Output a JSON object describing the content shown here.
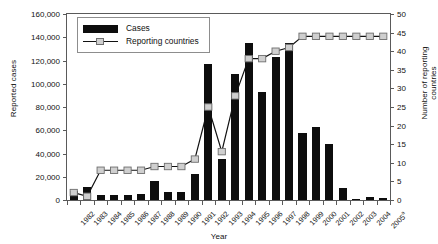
{
  "chart_data": {
    "type": "bar",
    "title": "",
    "xlabel": "Year",
    "ylabel": "Reported cases",
    "y2label": "Number of reporting countries",
    "grid": false,
    "legend_position": "upper-left-inside",
    "categories": [
      "1982",
      "1983",
      "1984",
      "1985",
      "1986",
      "1987",
      "1988",
      "1989",
      "1990",
      "1991",
      "1992",
      "1993",
      "1994",
      "1995",
      "1996",
      "1997",
      "1998",
      "1999",
      "2000",
      "2001",
      "2002",
      "2003",
      "2004",
      "2005"
    ],
    "category_labels": [
      "1982",
      "1983",
      "1984",
      "1985",
      "1986",
      "1987",
      "1988",
      "1989",
      "1990",
      "1991",
      "1992",
      "1993",
      "1994",
      "1995",
      "1996",
      "1997",
      "1998",
      "1999",
      "2000",
      "2001",
      "2002",
      "2003",
      "2004",
      "2005"
    ],
    "last_category_superscript": "a",
    "ylim": [
      0,
      160000
    ],
    "yticks": [
      0,
      20000,
      40000,
      60000,
      80000,
      100000,
      120000,
      140000,
      160000
    ],
    "ytick_labels": [
      "0",
      "20,000",
      "40,000",
      "60,000",
      "80,000",
      "100,000",
      "120,000",
      "140,000",
      "160,000"
    ],
    "y2lim": [
      0,
      50
    ],
    "y2ticks": [
      0,
      5,
      10,
      15,
      20,
      25,
      30,
      35,
      40,
      45,
      50
    ],
    "y2tick_labels": [
      "0",
      "5",
      "10",
      "15",
      "20",
      "25",
      "30",
      "35",
      "40",
      "45",
      "50"
    ],
    "series": [
      {
        "name": "Cases",
        "type": "bar",
        "axis": "left",
        "color": "#0d0d0d",
        "values": [
          7500,
          11000,
          4500,
          4500,
          4000,
          5500,
          16000,
          7000,
          6500,
          22500,
          117000,
          35000,
          108000,
          135000,
          93000,
          123000,
          135000,
          58000,
          63000,
          48000,
          10000,
          1200,
          3000,
          2000
        ]
      },
      {
        "name": "Reporting countries",
        "type": "line",
        "axis": "right",
        "color": "#111111",
        "marker_fill": "#cfcfcf",
        "marker_edge": "#6e6e6e",
        "values": [
          2,
          1,
          8,
          8,
          8,
          8,
          9,
          9,
          9,
          11,
          25,
          13,
          28,
          38,
          38,
          40,
          41,
          44,
          44,
          44,
          44,
          44,
          44,
          44
        ]
      }
    ]
  },
  "legend": {
    "items": [
      {
        "label": "Cases",
        "kind": "bar"
      },
      {
        "label": "Reporting countries",
        "kind": "line"
      }
    ]
  }
}
